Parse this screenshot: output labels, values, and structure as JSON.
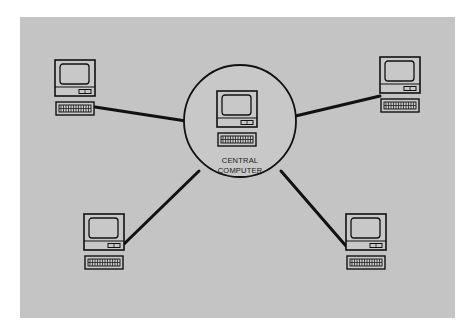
{
  "diagram": {
    "type": "star-network",
    "background_color": "#ffffff",
    "panel_color": "#c4c4c4",
    "stroke_color": "#111111",
    "hub": {
      "label_line1": "CENTRAL",
      "label_line2": "COMPUTER",
      "icon": "computer-terminal-icon"
    },
    "terminals": [
      {
        "position": "top-left",
        "icon": "computer-terminal-icon"
      },
      {
        "position": "top-right",
        "icon": "computer-terminal-icon"
      },
      {
        "position": "bottom-left",
        "icon": "computer-terminal-icon"
      },
      {
        "position": "bottom-right",
        "icon": "computer-terminal-icon"
      }
    ],
    "connections": [
      {
        "from": "central-computer",
        "to": "top-left"
      },
      {
        "from": "central-computer",
        "to": "top-right"
      },
      {
        "from": "central-computer",
        "to": "bottom-left"
      },
      {
        "from": "central-computer",
        "to": "bottom-right"
      }
    ]
  }
}
